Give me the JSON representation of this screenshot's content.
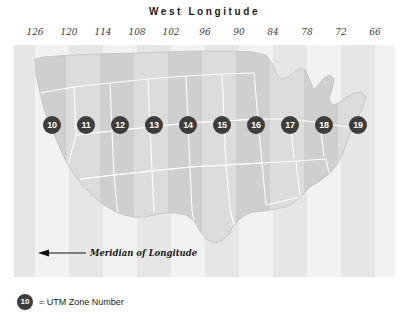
{
  "chart_data": {
    "type": "map",
    "title": "West Longitude",
    "xlabel": "West Longitude",
    "ylabel": "",
    "grid": true,
    "legend_position": "bottom-left",
    "x_tick_labels": [
      "126",
      "120",
      "114",
      "108",
      "102",
      "96",
      "90",
      "84",
      "78",
      "72",
      "66"
    ],
    "x_tick_values": [
      126,
      120,
      114,
      108,
      102,
      96,
      90,
      84,
      78,
      72,
      66
    ],
    "x_tick_positions_px": [
      35,
      69,
      103,
      137,
      171,
      205,
      239,
      273,
      307,
      341,
      375
    ],
    "zone_band_width_degrees": 6,
    "categories": [
      "10",
      "11",
      "12",
      "13",
      "14",
      "15",
      "16",
      "17",
      "18",
      "19"
    ],
    "values": [
      10,
      11,
      12,
      13,
      14,
      15,
      16,
      17,
      18,
      19
    ],
    "zones": [
      {
        "number": "10",
        "center_longitude": 123,
        "x_px": 35
      },
      {
        "number": "11",
        "center_longitude": 117,
        "x_px": 69
      },
      {
        "number": "12",
        "center_longitude": 111,
        "x_px": 103
      },
      {
        "number": "13",
        "center_longitude": 105,
        "x_px": 137
      },
      {
        "number": "14",
        "center_longitude": 99,
        "x_px": 171
      },
      {
        "number": "15",
        "center_longitude": 93,
        "x_px": 205
      },
      {
        "number": "16",
        "center_longitude": 87,
        "x_px": 239
      },
      {
        "number": "17",
        "center_longitude": 81,
        "x_px": 273
      },
      {
        "number": "18",
        "center_longitude": 75,
        "x_px": 307
      },
      {
        "number": "19",
        "center_longitude": 69,
        "x_px": 341
      }
    ],
    "annotations": [
      {
        "name": "meridian-of-longitude",
        "text": "Meridian of Longitude",
        "arrow": "left"
      }
    ],
    "colors": {
      "badge_fill": "#3d3d3d",
      "badge_text": "#ffffff",
      "band_light": "#f2f2f2",
      "band_dark": "#e6e6e6",
      "land_light": "#dcdcdc",
      "land_dark": "#c9c9c9",
      "state_border": "#ffffff",
      "text": "#1a1a1a",
      "background": "#ffffff"
    }
  },
  "legend": {
    "badge": "10",
    "text": "= UTM Zone Number"
  }
}
